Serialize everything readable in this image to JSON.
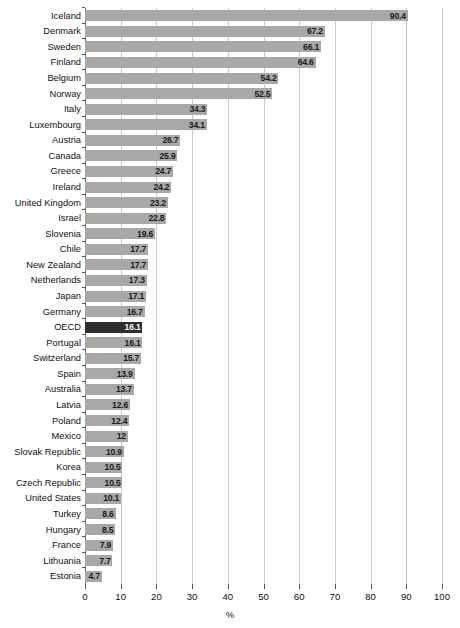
{
  "chart_data": {
    "type": "bar",
    "orientation": "horizontal",
    "title": "",
    "subtitle": "",
    "xlabel": "%",
    "ylabel": "",
    "xlim": [
      0,
      100
    ],
    "xticks": [
      0,
      10,
      20,
      30,
      40,
      50,
      60,
      70,
      80,
      90,
      100
    ],
    "xtick_labels": [
      "0",
      "10",
      "20",
      "30",
      "40",
      "50",
      "60",
      "70",
      "80",
      "90",
      "100"
    ],
    "grid": "vertical",
    "legend": "none",
    "bar_color": "#a8a8a8",
    "highlight_color": "#2e2e2e",
    "highlight_category": "OECD",
    "categories": [
      "Iceland",
      "Denmark",
      "Sweden",
      "Finland",
      "Belgium",
      "Norway",
      "Italy",
      "Luxembourg",
      "Austria",
      "Canada",
      "Greece",
      "Ireland",
      "United Kingdom",
      "Israel",
      "Slovenia",
      "Chile",
      "New Zealand",
      "Netherlands",
      "Japan",
      "Germany",
      "OECD",
      "Portugal",
      "Switzerland",
      "Spain",
      "Australia",
      "Latvia",
      "Poland",
      "Mexico",
      "Slovak Republic",
      "Korea",
      "Czech Republic",
      "United States",
      "Turkey",
      "Hungary",
      "France",
      "Lithuania",
      "Estonia"
    ],
    "values": [
      90.4,
      67.2,
      66.1,
      64.6,
      54.2,
      52.5,
      34.3,
      34.1,
      26.7,
      25.9,
      24.7,
      24.2,
      23.2,
      22.8,
      19.6,
      17.7,
      17.7,
      17.3,
      17.1,
      16.7,
      16.1,
      16.1,
      15.7,
      13.9,
      13.7,
      12.6,
      12.4,
      12,
      10.9,
      10.5,
      10.5,
      10.1,
      8.6,
      8.5,
      7.9,
      7.7,
      4.7
    ],
    "value_labels": [
      "90.4",
      "67.2",
      "66.1",
      "64.6",
      "54.2",
      "52.5",
      "34.3",
      "34.1",
      "26.7",
      "25.9",
      "24.7",
      "24.2",
      "23.2",
      "22.8",
      "19.6",
      "17.7",
      "17.7",
      "17.3",
      "17.1",
      "16.7",
      "16.1",
      "16.1",
      "15.7",
      "13.9",
      "13.7",
      "12.6",
      "12.4",
      "12",
      "10.9",
      "10.5",
      "10.5",
      "10.1",
      "8.6",
      "8.5",
      "7.9",
      "7.7",
      "4.7"
    ]
  }
}
